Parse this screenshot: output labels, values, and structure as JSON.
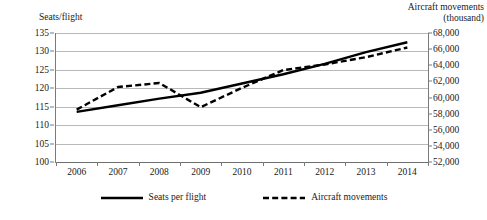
{
  "chart_data": {
    "type": "line",
    "title": "",
    "xlabel": "",
    "categories": [
      "2006",
      "2007",
      "2008",
      "2009",
      "2010",
      "2011",
      "2012",
      "2013",
      "2014"
    ],
    "grid": true,
    "legend_position": "bottom",
    "axes": {
      "left": {
        "label": "Seats/flight",
        "ylim": [
          100,
          135
        ],
        "step": 5,
        "ticks": [
          "100",
          "105",
          "110",
          "115",
          "120",
          "125",
          "130",
          "135"
        ],
        "tick_values": [
          100,
          105,
          110,
          115,
          120,
          125,
          130,
          135
        ]
      },
      "right": {
        "label": "Aircraft movements\n(thousand)",
        "ylim": [
          52000,
          68000
        ],
        "step": 2000,
        "ticks": [
          "52,000",
          "54,000",
          "56,000",
          "58,000",
          "60,000",
          "62,000",
          "64,000",
          "66,000",
          "68,000"
        ],
        "tick_values": [
          52000,
          54000,
          56000,
          58000,
          60000,
          62000,
          64000,
          66000,
          68000
        ]
      }
    },
    "series": [
      {
        "name": "Seats per flight",
        "axis": "left",
        "style": "solid",
        "color": "#000000",
        "values": [
          113.6,
          115.4,
          117.2,
          118.8,
          121.3,
          123.8,
          126.6,
          129.8,
          132.5
        ]
      },
      {
        "name": "Aircraft movements",
        "axis": "right",
        "style": "dashed",
        "color": "#000000",
        "values": [
          58500,
          61300,
          61800,
          58800,
          61200,
          63400,
          64100,
          65000,
          66200
        ]
      }
    ]
  },
  "legend": {
    "items": [
      {
        "label": "Seats per flight",
        "style": "solid"
      },
      {
        "label": "Aircraft movements",
        "style": "dashed"
      }
    ]
  },
  "colors": {
    "gridline": "#b9b9b9",
    "axis": "#7a7a7a",
    "series": "#000000",
    "background": "#ffffff"
  }
}
